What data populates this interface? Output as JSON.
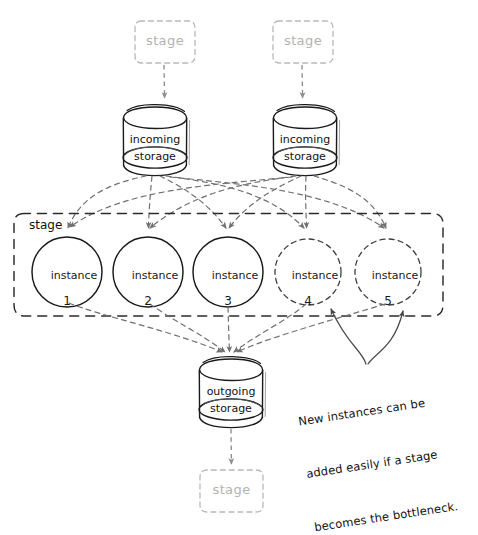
{
  "diagram": {
    "colors": {
      "ink": "#1a1a1a",
      "ghost": "#b2b2b2",
      "dashed_flow": "#707070",
      "stage_box_border": "#2b2b2b"
    },
    "top_stages": [
      {
        "label": "stage",
        "cx": 165,
        "cy": 42
      },
      {
        "label": "stage",
        "cx": 303,
        "cy": 42
      }
    ],
    "incoming_stores": [
      {
        "line1": "incoming",
        "line2": "storage",
        "cx": 155,
        "cy": 140
      },
      {
        "line1": "incoming",
        "line2": "storage",
        "cx": 305,
        "cy": 140
      }
    ],
    "stage_group": {
      "label": "stage",
      "x": 14,
      "y": 213,
      "w": 429,
      "h": 103
    },
    "instances": [
      {
        "label": "instance",
        "number": "1",
        "cx": 67,
        "cy": 272,
        "r": 35,
        "style": "solid"
      },
      {
        "label": "instance",
        "number": "2",
        "cx": 148,
        "cy": 272,
        "r": 35,
        "style": "solid"
      },
      {
        "label": "instance",
        "number": "3",
        "cx": 228,
        "cy": 272,
        "r": 35,
        "style": "solid"
      },
      {
        "label": "instance",
        "number": "4",
        "cx": 308,
        "cy": 272,
        "r": 33,
        "style": "dashed"
      },
      {
        "label": "instance",
        "number": "5",
        "cx": 388,
        "cy": 272,
        "r": 33,
        "style": "dashed"
      }
    ],
    "outgoing_store": {
      "line1": "outgoing",
      "line2": "storage",
      "cx": 231,
      "cy": 392
    },
    "bottom_stage": {
      "label": "stage",
      "cx": 232,
      "cy": 491
    },
    "annotation": {
      "line1": "New instances can be",
      "line2": "added easily if a stage",
      "line3": "becomes the bottleneck.",
      "x": 292,
      "y": 378,
      "points_to": [
        "instance-4",
        "instance-5"
      ]
    }
  }
}
